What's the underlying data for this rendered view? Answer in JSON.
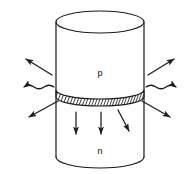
{
  "figure": {
    "name": "pn-junction-light-emission-diagram",
    "type": "line-drawing",
    "background_color": "#ffffff",
    "stroke_color": "#1a1a1a",
    "labels": {
      "p_region": "p",
      "n_region": "n"
    },
    "geometry": {
      "cylinder": {
        "left_x": 56,
        "right_x": 144,
        "top_ellipse_cy": 22,
        "top_ellipse_ry": 11,
        "bottom_arc_cy": 157,
        "bottom_arc_ry": 11,
        "junction_cy": 97,
        "junction_ry": 9,
        "junction_band_height": 7
      }
    },
    "junction_band": {
      "name": "hatched-junction-band",
      "hatch_count": 34,
      "hatch_angle_deg": 28
    },
    "emission_arrows": [
      {
        "id": "arrow-upper-left",
        "direction": "up-left",
        "tail": [
          52,
          75
        ],
        "head": [
          24,
          58
        ],
        "wavy": false
      },
      {
        "id": "arrow-left",
        "direction": "left",
        "tail": [
          54,
          87
        ],
        "head": [
          9,
          87
        ],
        "wavy": true
      },
      {
        "id": "arrow-lower-left",
        "direction": "down-left",
        "tail": [
          58,
          101
        ],
        "head": [
          27,
          118
        ],
        "wavy": false
      },
      {
        "id": "arrow-upper-right",
        "direction": "up-right",
        "tail": [
          148,
          75
        ],
        "head": [
          176,
          58
        ],
        "wavy": false
      },
      {
        "id": "arrow-right",
        "direction": "right",
        "tail": [
          146,
          87
        ],
        "head": [
          181,
          87
        ],
        "wavy": true
      },
      {
        "id": "arrow-lower-right",
        "direction": "down-right",
        "tail": [
          142,
          101
        ],
        "head": [
          172,
          118
        ],
        "wavy": false
      }
    ],
    "internal_arrows": [
      {
        "id": "arrow-down-1",
        "direction": "down",
        "tail": [
          76,
          112
        ],
        "head": [
          76,
          136
        ]
      },
      {
        "id": "arrow-down-2",
        "direction": "down",
        "tail": [
          101,
          112
        ],
        "head": [
          101,
          136
        ]
      },
      {
        "id": "arrow-down-3",
        "direction": "down-right",
        "tail": [
          118,
          110
        ],
        "head": [
          130,
          133
        ]
      }
    ]
  }
}
